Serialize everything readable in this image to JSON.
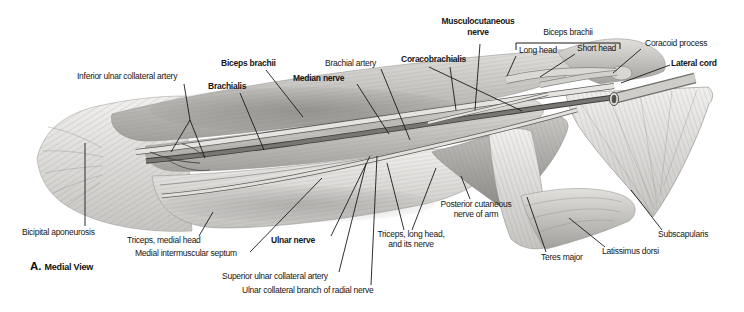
{
  "figure": {
    "view_letter": "A.",
    "view_title": "Medial View"
  },
  "labels": {
    "inferior_ulnar_collateral_artery": "Inferior ulnar collateral artery",
    "biceps_brachii_left": "Biceps brachii",
    "brachialis": "Brachialis",
    "median_nerve": "Median nerve",
    "brachial_artery": "Brachial artery",
    "coracobrachialis": "Coracobrachialis",
    "musculocutaneous_nerve_line1": "Musculocutaneous",
    "musculocutaneous_nerve_line2": "nerve",
    "biceps_brachii_bracket": "Biceps brachii",
    "long_head": "Long head",
    "short_head": "Short head",
    "coracoid_process": "Coracoid process",
    "lateral_cord": "Lateral cord",
    "bicipital_aponeurosis": "Bicipital aponeurosis",
    "triceps_medial_head": "Triceps, medial head",
    "medial_intermuscular_septum": "Medial intermuscular septum",
    "ulnar_nerve": "Ulnar nerve",
    "superior_ulnar_collateral_artery": "Superior ulnar collateral artery",
    "ulnar_collateral_branch_of_radial_nerve": "Ulnar collateral branch of radial nerve",
    "triceps_long_head_line1": "Triceps, long head,",
    "triceps_long_head_line2": "and its nerve",
    "posterior_cutaneous_line1": "Posterior cutaneous",
    "posterior_cutaneous_line2": "nerve of arm",
    "teres_major": "Teres major",
    "latissimus_dorsi": "Latissimus dorsi",
    "subscapularis": "Subscapularis"
  },
  "colors": {
    "background": "#ffffff",
    "label_text": "#161616",
    "leader_line": "#1a1a1a"
  }
}
